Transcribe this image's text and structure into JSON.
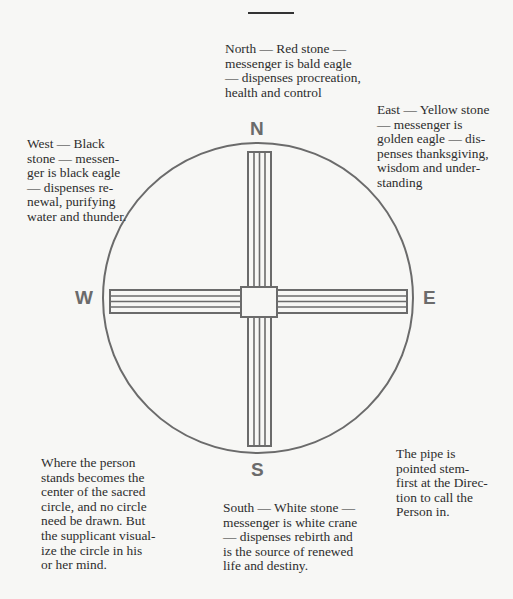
{
  "diagram": {
    "type": "medicine-wheel",
    "colors": {
      "stroke": "#6b6b6b",
      "text": "#2d2d2d",
      "background": "#f7f7f5"
    },
    "directions": {
      "north": {
        "label": "N"
      },
      "south": {
        "label": "S"
      },
      "west": {
        "label": "W"
      },
      "east": {
        "label": "E"
      }
    },
    "notes": {
      "north": "North — Red stone —\nmessenger is bald eagle\n— dispenses procreation,\nhealth and control",
      "east": "East — Yellow stone\n— messenger is\ngolden eagle — dis-\npenses thanksgiving,\nwisdom and under-\nstanding",
      "west": "West — Black\nstone — messen-\nger is black eagle\n— dispenses re-\nnewal, purifying\nwater and thunder.",
      "center": "Where the person\nstands becomes the\ncenter of the sacred\ncircle, and no circle\nneed be drawn. But\nthe supplicant visual-\nize the circle in his\nor her mind.",
      "south": "South — White stone —\nmessenger is white crane\n— dispenses rebirth and\nis the source of renewed\nlife and destiny.",
      "pipe": "The pipe is\npointed stem-\nfirst at the Direc-\ntion to call the\nPerson in."
    }
  }
}
